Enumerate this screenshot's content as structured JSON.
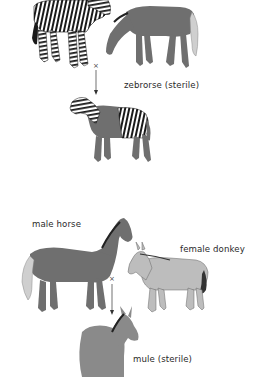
{
  "diagram": {
    "type": "hybrid-cross-illustration",
    "panels": [
      {
        "id": "zebrorse",
        "parents": [
          "zebra",
          "horse"
        ],
        "cross_symbol": "×",
        "offspring_label": "zebrorse (sterile)"
      },
      {
        "id": "mule",
        "parent_labels": {
          "father": "male horse",
          "mother": "female donkey"
        },
        "cross_symbol": "×",
        "offspring_label": "mule (sterile)"
      }
    ]
  },
  "colors": {
    "background": "#ffffff",
    "horse_body": "#6f6f6f",
    "donkey_body": "#bdbdbd",
    "mule_body": "#8a8a8a",
    "stripe": "#1a1a1a",
    "text": "#2a2a2a"
  }
}
